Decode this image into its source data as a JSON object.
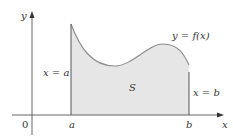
{
  "figure": {
    "type": "area-under-curve",
    "colors": {
      "region_fill": "#e6e6e6",
      "curve": "#8a8a8a",
      "axes": "#555555",
      "bounds": "#555555",
      "text": "#333333"
    }
  },
  "labels": {
    "y_axis": "y",
    "x_axis": "x",
    "origin": "0",
    "a_tick": "a",
    "b_tick": "b",
    "left_bound": "x = a",
    "right_bound": "x = b",
    "curve": "y = f(x)",
    "region": "S"
  },
  "icons": {
    "x_arrow": "arrow-right-icon",
    "y_arrow": "arrow-up-icon"
  }
}
